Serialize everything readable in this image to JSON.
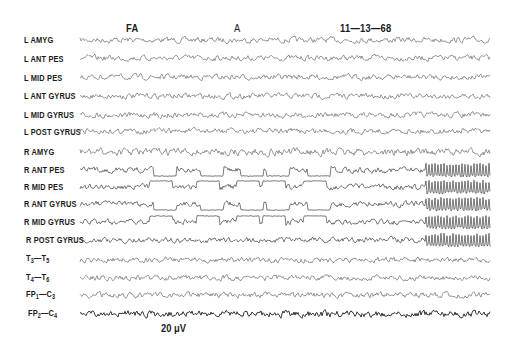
{
  "header": {
    "marker_fa": "FA",
    "marker_a": "A",
    "date": "11—13—68"
  },
  "calibration": "20 μV",
  "chart_data": {
    "type": "line",
    "title": "",
    "subtitle": "EEG depth and scalp electrode recording, seizure onset on right-hemisphere depth leads",
    "annotations": [
      {
        "text": "FA",
        "x_fraction": 0.12
      },
      {
        "text": "A",
        "x_fraction": 0.39
      },
      {
        "text": "11—13—68",
        "x_fraction": 0.68
      },
      {
        "text": "20 μV",
        "position": "bottom-left",
        "role": "amplitude calibration"
      }
    ],
    "xlabel": "",
    "ylabel": "",
    "grid": false,
    "legend": "none",
    "channels": [
      {
        "name": "L AMYG",
        "y": 40,
        "activity": "low-amplitude mixed"
      },
      {
        "name": "L ANT PES",
        "y": 58,
        "activity": "low-amplitude mixed"
      },
      {
        "name": "L MID PES",
        "y": 77,
        "activity": "low-amplitude mixed"
      },
      {
        "name": "L ANT GYRUS",
        "y": 96,
        "activity": "low-amplitude mixed"
      },
      {
        "name": "L MID GYRUS",
        "y": 115,
        "activity": "low-amplitude mixed"
      },
      {
        "name": "L POST GYRUS",
        "y": 131,
        "activity": "low-amplitude mixed"
      },
      {
        "name": "R AMYG",
        "y": 152,
        "activity": "moderate slow waves"
      },
      {
        "name": "R ANT PES",
        "y": 170,
        "activity": "square-wave discharges then rhythmic high-frequency burst"
      },
      {
        "name": "R MID PES",
        "y": 187,
        "activity": "square-wave discharges then rhythmic high-frequency burst"
      },
      {
        "name": "R ANT GYRUS",
        "y": 204,
        "activity": "square-wave discharges then rhythmic high-frequency burst"
      },
      {
        "name": "R MID GYRUS",
        "y": 222,
        "activity": "square-wave discharges then rhythmic high-frequency burst"
      },
      {
        "name": "R POST GYRUS",
        "y": 240,
        "activity": "spikes then rhythmic high-frequency burst"
      },
      {
        "name": "T3—T5",
        "y": 260,
        "activity": "low-amplitude mixed"
      },
      {
        "name": "T4—T6",
        "y": 278,
        "activity": "low-amplitude mixed"
      },
      {
        "name": "FP1—C3",
        "y": 295,
        "activity": "low-amplitude mixed"
      },
      {
        "name": "FP2—C4",
        "y": 314,
        "activity": "higher-amplitude fast activity"
      }
    ],
    "square_wave_x": [
      150,
      197,
      237,
      263,
      304
    ],
    "burst_onset_x": 426,
    "trace_x_range": [
      80,
      490
    ]
  },
  "labels": {
    "l_amyg": "L AMYG",
    "l_ant_pes": "L ANT PES",
    "l_mid_pes": "L MID PES",
    "l_ant_gyrus": "L ANT GYRUS",
    "l_mid_gyrus": "L MID GYRUS",
    "l_post_gyrus": "L POST GYRUS",
    "r_amyg": "R AMYG",
    "r_ant_pes": "R ANT PES",
    "r_mid_pes": "R MID PES",
    "r_ant_gyrus": "R ANT GYRUS",
    "r_mid_gyrus": "R MID GYRUS",
    "r_post_gyrus": "R POST GYRUS",
    "t3_main": "T",
    "t3_sub": "3",
    "t5_main": "T",
    "t5_sub": "5",
    "t4_main": "T",
    "t4_sub": "4",
    "t6_main": "T",
    "t6_sub": "6",
    "fp1_main": "FP",
    "fp1_sub": "1",
    "c3_main": "C",
    "c3_sub": "3",
    "fp2_main": "FP",
    "fp2_sub": "2",
    "c4_main": "C",
    "c4_sub": "4",
    "dash": "—"
  }
}
